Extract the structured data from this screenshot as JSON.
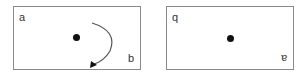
{
  "diagram": {
    "left_panel": {
      "label_top_left": "a",
      "label_bottom_right": "b",
      "center_point": "dot",
      "arrow": "clockwise-rotation-arrow"
    },
    "right_panel": {
      "label_top_left": "q",
      "label_bottom_right": "a",
      "label_bottom_right_rotated": true,
      "center_point": "dot"
    },
    "colors": {
      "border": "#8a8a8a",
      "dot": "#111111",
      "arrow": "#555555",
      "text": "#333333"
    }
  }
}
